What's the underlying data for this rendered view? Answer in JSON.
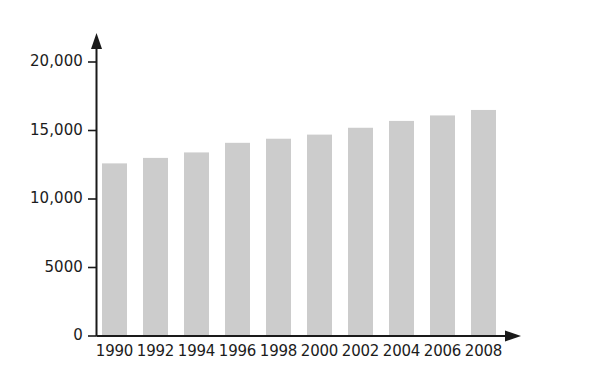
{
  "chart_data": {
    "type": "bar",
    "title": "",
    "subtitle": "",
    "xlabel": "",
    "ylabel": "",
    "categories": [
      "1990",
      "1992",
      "1994",
      "1996",
      "1998",
      "2000",
      "2002",
      "2004",
      "2006",
      "2008"
    ],
    "values": [
      12600,
      13000,
      13400,
      14100,
      14400,
      14700,
      15200,
      15700,
      16100,
      16500
    ],
    "series": [
      {
        "name": "",
        "values": [
          12600,
          13000,
          13400,
          14100,
          14400,
          14700,
          15200,
          15700,
          16100,
          16500
        ]
      }
    ],
    "ylim": [
      0,
      20000
    ],
    "yticks": [
      0,
      5000,
      10000,
      15000,
      20000
    ],
    "ytick_labels": [
      "0",
      "5000",
      "10,000",
      "15,000",
      "20,000"
    ],
    "xtick_labels": [
      "1990",
      "1992",
      "1994",
      "1996",
      "1998",
      "2000",
      "2002",
      "2004",
      "2006",
      "2008"
    ],
    "grid": false,
    "legend": null,
    "legend_position": "none",
    "annotations": [],
    "axis_arrows": {
      "y_axis_arrow": "up-arrow",
      "x_axis_arrow": "right-arrow"
    },
    "colors": {
      "bar_fill": "#cccccc",
      "axis_line": "#1a1a1a",
      "tick_label": "#1c1c1c",
      "background": "#ffffff"
    }
  },
  "axis": {
    "y_labels": [
      {
        "text": "20,000",
        "value": 20000
      },
      {
        "text": "15,000",
        "value": 15000
      },
      {
        "text": "10,000",
        "value": 10000
      },
      {
        "text": "5000",
        "value": 5000
      },
      {
        "text": "0",
        "value": 0
      }
    ],
    "x_labels": [
      {
        "text": "1990"
      },
      {
        "text": "1992"
      },
      {
        "text": "1994"
      },
      {
        "text": "1996"
      },
      {
        "text": "1998"
      },
      {
        "text": "2000"
      },
      {
        "text": "2002"
      },
      {
        "text": "2004"
      },
      {
        "text": "2006"
      },
      {
        "text": "2008"
      }
    ]
  }
}
